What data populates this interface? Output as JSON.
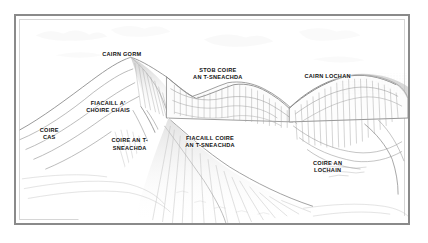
{
  "illustration": {
    "type": "line-drawing-panorama",
    "subject": "Cairngorms mountain panorama with named corries and ridges",
    "frame_color": "#8a8a8a",
    "background_color": "#ffffff",
    "ink_color": "#9a9a9a",
    "label_color": "#111111",
    "labels": [
      {
        "id": "cairn-gorm",
        "text": "CAIRN GORM",
        "x": 27.0,
        "y": 17.0
      },
      {
        "id": "stob-coire-an-t-sneachda",
        "text": "STOB COIRE\nAN T-SNEACHDA",
        "x": 51.5,
        "y": 24.5
      },
      {
        "id": "cairn-lochan",
        "text": "CAIRN LOCHAN",
        "x": 79.5,
        "y": 27.5
      },
      {
        "id": "fiacaill-a-choire-chais",
        "text": "FIACAILL A'\nCHOIRE CHAIS",
        "x": 23.5,
        "y": 40.5
      },
      {
        "id": "coire-cas",
        "text": "COIRE\nCAS",
        "x": 8.5,
        "y": 53.5
      },
      {
        "id": "coire-an-t-sneachda",
        "text": "COIRE AN T-\nSNEACHDA",
        "x": 29.0,
        "y": 58.5
      },
      {
        "id": "fiacaill-coire-an-t-sneachda",
        "text": "FIACAILL COIRE\nAN T-SNEACHDA",
        "x": 49.5,
        "y": 57.5
      },
      {
        "id": "coire-an-lochain",
        "text": "COIRE AN\nLOCHAIN",
        "x": 79.5,
        "y": 69.5
      }
    ]
  }
}
